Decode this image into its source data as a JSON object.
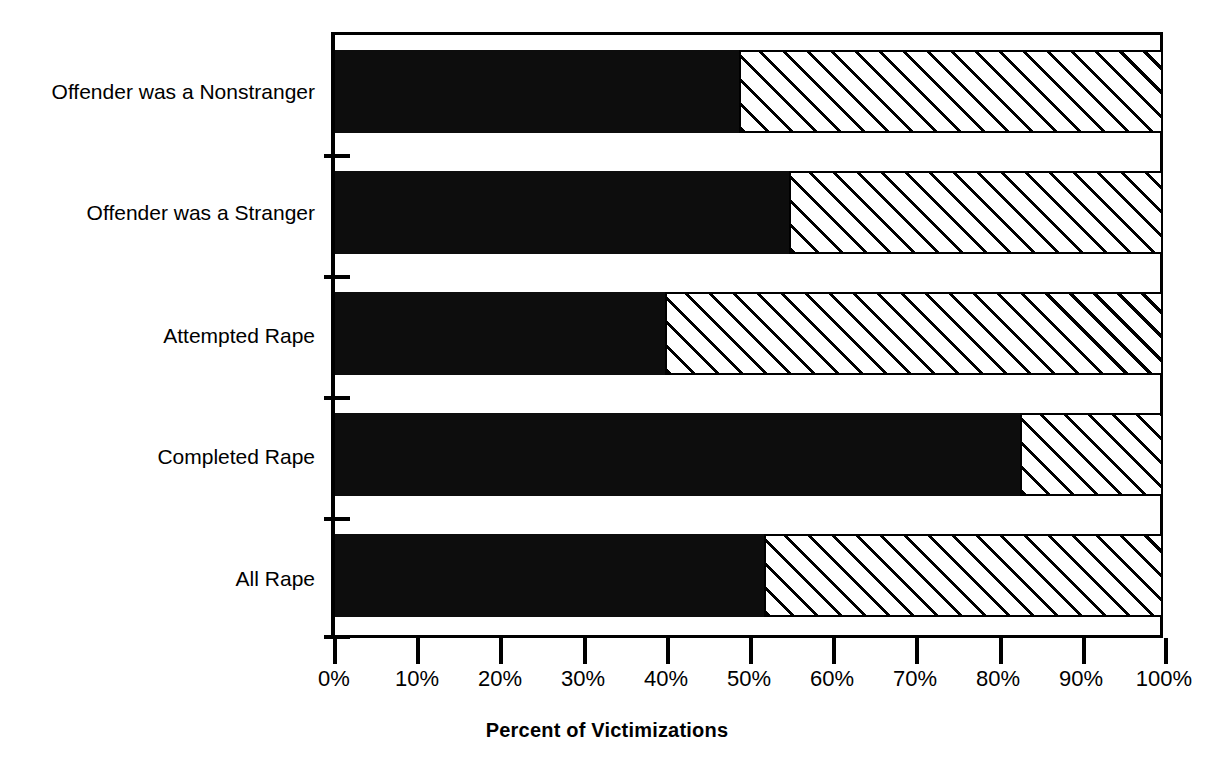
{
  "chart_data": {
    "type": "bar",
    "orientation": "horizontal",
    "stacked": true,
    "title": "",
    "xlabel": "Percent of Victimizations",
    "ylabel": "",
    "xlim": [
      0,
      100
    ],
    "xticks": [
      "0%",
      "10%",
      "20%",
      "30%",
      "40%",
      "50%",
      "60%",
      "70%",
      "80%",
      "90%",
      "100%"
    ],
    "xtick_values": [
      0,
      10,
      20,
      30,
      40,
      50,
      60,
      70,
      80,
      90,
      100
    ],
    "grid": false,
    "legend": "none",
    "categories": [
      "Offender was a Nonstranger",
      "Offender was a Stranger",
      "Attempted Rape",
      "Completed Rape",
      "All Rape"
    ],
    "series": [
      {
        "name": "Reported",
        "fill": "solid-black",
        "color": "#0d0d0d",
        "values": [
          49,
          55,
          40,
          83,
          52
        ]
      },
      {
        "name": "Not Reported",
        "fill": "diagonal-hatch",
        "color": "#ffffff",
        "values": [
          51,
          45,
          60,
          17,
          48
        ]
      }
    ]
  },
  "labels": {
    "cat0": "Offender was a Nonstranger",
    "cat1": "Offender was a Stranger",
    "cat2": "Attempted Rape",
    "cat3": "Completed Rape",
    "cat4": "All Rape"
  },
  "xaxis": {
    "title": "Percent of Victimizations",
    "tick0": "0%",
    "tick1": "10%",
    "tick2": "20%",
    "tick3": "30%",
    "tick4": "40%",
    "tick5": "50%",
    "tick6": "60%",
    "tick7": "70%",
    "tick8": "80%",
    "tick9": "90%",
    "tick10": "100%"
  },
  "colors": {
    "bar_dark": "#0d0d0d",
    "bar_hatch_line": "#000000",
    "bar_hatch_bg": "#ffffff",
    "axis": "#000000",
    "text": "#000000"
  }
}
